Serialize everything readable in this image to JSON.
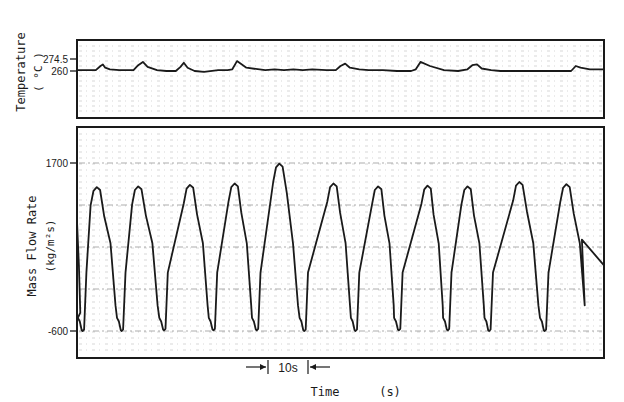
{
  "chart_data": [
    {
      "type": "line",
      "panel": "top",
      "title": "",
      "ylabel": "Temperature",
      "yunit": "( °C )",
      "yticks": [
        274.5,
        260
      ],
      "ytick_labels": [
        "274.5",
        "260"
      ],
      "ylim": [
        246,
        290
      ],
      "grid": true,
      "description": "Near-constant temperature trace around 260 °C with small spikes (up to ~270 °C) coinciding with flow oscillations",
      "x_seconds": [
        0,
        2,
        4,
        5,
        5.5,
        6,
        7,
        9,
        12,
        13,
        14,
        15,
        17,
        19,
        21,
        22,
        22.7,
        23.5,
        25,
        27,
        30,
        32,
        33,
        34,
        36,
        40,
        42,
        44,
        46,
        48,
        50,
        53,
        55,
        56,
        57,
        58,
        60,
        62,
        65,
        68,
        71,
        72,
        73,
        75,
        78,
        81,
        83,
        84,
        85,
        86,
        88,
        90,
        93,
        96,
        100,
        102,
        105,
        106,
        107,
        109,
        112
      ],
      "values": [
        261,
        261,
        261,
        266,
        268,
        264,
        262,
        261,
        261,
        267,
        271,
        265,
        261,
        260,
        260,
        265,
        270,
        264,
        260,
        259,
        261,
        261,
        262,
        272,
        264,
        261,
        262,
        261,
        262,
        261,
        262,
        261,
        261,
        266,
        269,
        264,
        262,
        261,
        261,
        260,
        260,
        262,
        271,
        266,
        261,
        260,
        262,
        267,
        268,
        263,
        261,
        260,
        260,
        260,
        260,
        260,
        260,
        266,
        264,
        262,
        262
      ]
    },
    {
      "type": "line",
      "panel": "bottom",
      "title": "",
      "ylabel": "Mass Flow Rate",
      "yunit": "(kg/m²s)",
      "yticks": [
        1700,
        -600
      ],
      "ytick_labels": [
        "1700",
        "-600"
      ],
      "ylim": [
        -900,
        2250
      ],
      "grid": true,
      "description": "Periodic density-wave oscillation, ~9-10 s period, peaks ~1400-1700, troughs ~-600",
      "peaks_seconds": [
        4.2,
        13,
        24,
        33.5,
        43,
        54.5,
        64,
        74.5,
        83,
        94,
        104
      ],
      "peak_values": [
        1370,
        1380,
        1400,
        1420,
        1690,
        1420,
        1380,
        1390,
        1380,
        1440,
        1410
      ],
      "troughs_seconds": [
        1.2,
        9.5,
        18.5,
        29,
        38.2,
        48.3,
        59.2,
        68.4,
        78.8,
        87.6,
        99.4
      ],
      "trough_values": [
        -600,
        -600,
        -590,
        -590,
        -590,
        -600,
        -600,
        -590,
        -590,
        -600,
        -600
      ]
    }
  ],
  "figure": {
    "xlabel": "Time",
    "xunit": "(s)",
    "scale_bar_label": "10s",
    "scale_bar_seconds": 10
  }
}
